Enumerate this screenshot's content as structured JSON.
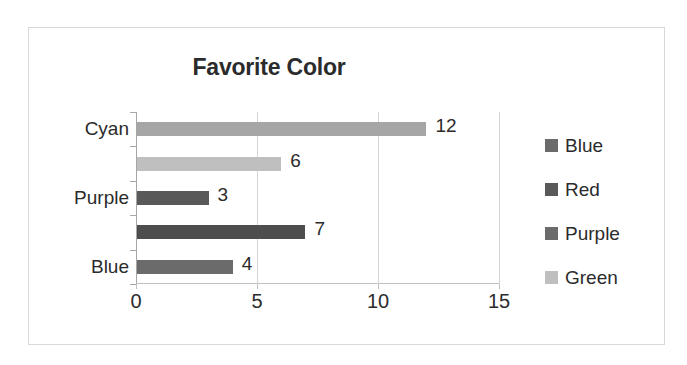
{
  "chart_data": {
    "type": "bar",
    "orientation": "horizontal",
    "title": "Favorite Color",
    "xlabel": "",
    "ylabel": "",
    "xlim": [
      0,
      15
    ],
    "xticks": [
      0,
      5,
      10,
      15
    ],
    "xtick_labels": [
      "0",
      "5",
      "10",
      "15"
    ],
    "grid": true,
    "grid_axis": "x",
    "legend_position": "right",
    "categories": [
      "Blue",
      "Red",
      "Purple",
      "Green",
      "Cyan"
    ],
    "visible_category_labels": [
      "Blue",
      "",
      "Purple",
      "",
      "Cyan"
    ],
    "values": [
      4,
      7,
      3,
      6,
      12
    ],
    "data_labels": [
      "4",
      "7",
      "3",
      "6",
      "12"
    ],
    "bars": [
      {
        "category": "Cyan",
        "value": 12,
        "label": "12",
        "color": "#a6a6a6"
      },
      {
        "category": "Green",
        "value": 6,
        "label": "6",
        "color": "#bfbfbf"
      },
      {
        "category": "Purple",
        "value": 3,
        "label": "3",
        "color": "#595959"
      },
      {
        "category": "Red",
        "value": 7,
        "label": "7",
        "color": "#4d4d4d"
      },
      {
        "category": "Blue",
        "value": 4,
        "label": "4",
        "color": "#6b6b6b"
      }
    ],
    "legend": [
      {
        "label": "Blue",
        "color": "#6b6b6b"
      },
      {
        "label": "Red",
        "color": "#595959"
      },
      {
        "label": "Purple",
        "color": "#6b6b6b"
      },
      {
        "label": "Green",
        "color": "#bfbfbf"
      }
    ]
  },
  "colors": {
    "text": "#2b2b2b",
    "frame_border": "#d9d9d9",
    "gridline": "#d4d4d4",
    "axis": "#a6a6a6",
    "background": "#ffffff"
  }
}
